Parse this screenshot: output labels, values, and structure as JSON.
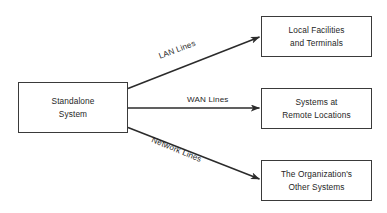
{
  "diagram": {
    "background_color": "#ffffff",
    "line_color": "#2b2b2b",
    "text_color": "#262626",
    "nodes": [
      {
        "id": "standalone",
        "label": "Standalone\nSystem",
        "role": "source"
      },
      {
        "id": "local",
        "label": "Local Facilities\nand Terminals",
        "role": "target"
      },
      {
        "id": "remote",
        "label": "Systems at\nRemote Locations",
        "role": "target"
      },
      {
        "id": "org",
        "label": "The Organization's\nOther Systems",
        "role": "target"
      }
    ],
    "edges": [
      {
        "id": "lan",
        "label": "LAN Lines",
        "from": "standalone",
        "to": "local",
        "arrow": "single",
        "orientation": "up"
      },
      {
        "id": "wan",
        "label": "WAN Lines",
        "from": "standalone",
        "to": "remote",
        "arrow": "single",
        "orientation": "horizontal"
      },
      {
        "id": "network",
        "label": "Network Lines",
        "from": "standalone",
        "to": "org",
        "arrow": "single",
        "orientation": "down"
      }
    ]
  }
}
